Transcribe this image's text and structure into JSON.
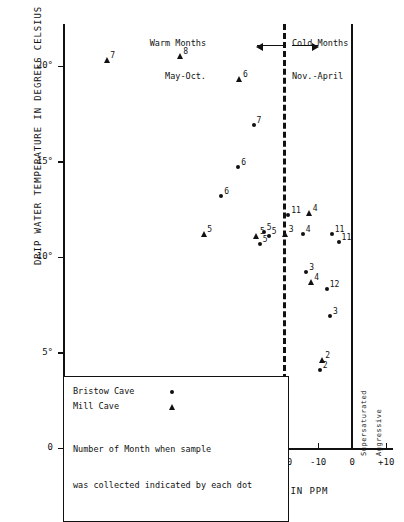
{
  "chart_data": {
    "type": "scatter",
    "title": "",
    "xlabel": "AGGRESSIVITY TO CALCIUM CARBONATE IN PPM",
    "ylabel": "DRIP WATER TEMPERATURE IN DEGREES CELSIUS",
    "xlim": [
      -85,
      12
    ],
    "ylim": [
      0,
      22.2
    ],
    "xticks": [
      -80,
      -70,
      -60,
      -50,
      -40,
      -30,
      -20,
      -10,
      0,
      10
    ],
    "xticklabels": [
      "-80",
      "-70",
      "-60",
      "-50",
      "-40",
      "-30",
      "-20",
      "-10",
      "0",
      "+10"
    ],
    "yticks": [
      0,
      5,
      10,
      15,
      20
    ],
    "yticklabels": [
      "0",
      "5°",
      "10°",
      "15°",
      "20°"
    ],
    "grid": false,
    "legend_position": "lower-left",
    "series": [
      {
        "name": "Bristow Cave",
        "marker": "dot",
        "points": [
          {
            "x": -29.0,
            "y": 16.9,
            "label": "7"
          },
          {
            "x": -33.5,
            "y": 14.7,
            "label": "6"
          },
          {
            "x": -38.5,
            "y": 13.2,
            "label": "6"
          },
          {
            "x": -26.0,
            "y": 11.3,
            "label": "5"
          },
          {
            "x": -27.2,
            "y": 10.7,
            "label": "5"
          },
          {
            "x": -24.5,
            "y": 11.1,
            "label": "5"
          },
          {
            "x": -18.8,
            "y": 12.2,
            "label": "11"
          },
          {
            "x": -14.5,
            "y": 11.2,
            "label": "4"
          },
          {
            "x": -6.0,
            "y": 11.2,
            "label": "11"
          },
          {
            "x": -4.0,
            "y": 10.8,
            "label": "11"
          },
          {
            "x": -13.5,
            "y": 9.2,
            "label": "3"
          },
          {
            "x": -7.5,
            "y": 8.3,
            "label": "12"
          },
          {
            "x": -6.5,
            "y": 6.9,
            "label": "3"
          },
          {
            "x": -9.5,
            "y": 4.1,
            "label": "2"
          }
        ]
      },
      {
        "name": "Mill Cave",
        "marker": "triangle",
        "points": [
          {
            "x": -72.0,
            "y": 20.3,
            "label": "7"
          },
          {
            "x": -50.5,
            "y": 20.5,
            "label": "8"
          },
          {
            "x": -33.0,
            "y": 19.3,
            "label": "6"
          },
          {
            "x": -43.5,
            "y": 11.2,
            "label": "5"
          },
          {
            "x": -28.0,
            "y": 11.1,
            "label": "5"
          },
          {
            "x": -19.5,
            "y": 11.2,
            "label": "3"
          },
          {
            "x": -12.5,
            "y": 12.3,
            "label": "4"
          },
          {
            "x": -12.0,
            "y": 8.7,
            "label": "4"
          },
          {
            "x": -8.8,
            "y": 4.6,
            "label": "2"
          }
        ]
      }
    ],
    "annotations": {
      "divider_x": -20,
      "warm_line1": "Warm Months",
      "warm_line2": "May-Oct.",
      "cold_line1": "Cold Months",
      "cold_line2": "Nov.-April",
      "zero_left_caption": "Supersaturated",
      "zero_right_caption": "Aggressive"
    },
    "legend": {
      "bristow_label": "Bristow Cave",
      "mill_label": "Mill Cave",
      "note_line1": "Number of Month when sample",
      "note_line2": "was collected indicated by each dot"
    }
  }
}
